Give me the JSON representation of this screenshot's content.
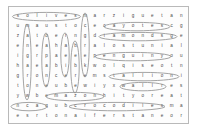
{
  "document": {
    "type": "word-search-puzzle",
    "title": "Word Search Puzzle",
    "grid_rows": 11,
    "grid_cols": 18,
    "ink_color": "#4a4a4a",
    "circle_color": "#8d8d8d",
    "border_color": "#b9b9b9",
    "paper_color": "#fdfdfd"
  },
  "grid": {
    "rows": [
      [
        "s",
        "o",
        "l",
        "i",
        "v",
        "e",
        "s",
        "m",
        "a",
        "r",
        "z",
        "i",
        "g",
        "u",
        "e",
        "t",
        "a",
        "n"
      ],
      [
        "u",
        "m",
        "a",
        "u",
        "s",
        "t",
        "o",
        "c",
        "e",
        "c",
        "a",
        "y",
        "o",
        "t",
        "e",
        "s",
        "c",
        "g"
      ],
      [
        "z",
        "a",
        "t",
        "o",
        "e",
        "r",
        "n",
        "g",
        "d",
        "i",
        "a",
        "m",
        "o",
        "n",
        "d",
        "s",
        "g",
        "e"
      ],
      [
        "e",
        "n",
        "e",
        "a",
        "h",
        "a",
        "b",
        "r",
        "a",
        "l",
        "o",
        "s",
        "t",
        "u",
        "n",
        "i",
        "a",
        "l"
      ],
      [
        "i",
        "g",
        "r",
        "p",
        "a",
        "e",
        "e",
        "e",
        "p",
        "e",
        "n",
        "g",
        "u",
        "i",
        "n",
        "y",
        "o",
        "u"
      ],
      [
        "h",
        "a",
        "e",
        "a",
        "b",
        "i",
        "b",
        "k",
        "w",
        "o",
        "l",
        "q",
        "i",
        "s",
        "e",
        "o",
        "t",
        "n"
      ],
      [
        "g",
        "r",
        "o",
        "n",
        "c",
        "e",
        "r",
        "e",
        "m",
        "s",
        "t",
        "a",
        "l",
        "l",
        "i",
        "o",
        "n",
        "i"
      ],
      [
        "t",
        "o",
        "n",
        "e",
        "u",
        "b",
        "e",
        "w",
        "i",
        "y",
        "x",
        "w",
        "a",
        "l",
        "l",
        "r",
        "e",
        "s"
      ],
      [
        "y",
        "w",
        "b",
        "e",
        "m",
        "a",
        "z",
        "o",
        "n",
        "h",
        "i",
        "t",
        "y",
        "o",
        "r",
        "e",
        "a",
        "t"
      ],
      [
        "n",
        "c",
        "a",
        "q",
        "u",
        "b",
        "c",
        "r",
        "o",
        "c",
        "o",
        "d",
        "i",
        "l",
        "e",
        "s",
        "m",
        "a"
      ],
      [
        "e",
        "s",
        "r",
        "t",
        "o",
        "n",
        "a",
        "i",
        "f",
        "e",
        "r",
        "s",
        "t",
        "a",
        "n",
        "e",
        "o",
        "r"
      ]
    ]
  },
  "found_words": [
    {
      "label": "solives",
      "orientation": "horizontal",
      "row": 0,
      "col_start": 0,
      "col_end": 6
    },
    {
      "label": "cayote",
      "orientation": "horizontal",
      "row": 1,
      "col_start": 9,
      "col_end": 16
    },
    {
      "label": "diamonds",
      "orientation": "horizontal",
      "row": 2,
      "col_start": 8,
      "col_end": 17
    },
    {
      "label": "penguin",
      "orientation": "horizontal",
      "row": 4,
      "col_start": 8,
      "col_end": 16
    },
    {
      "label": "stallion",
      "orientation": "horizontal",
      "row": 6,
      "col_start": 9,
      "col_end": 17
    },
    {
      "label": "wall",
      "orientation": "horizontal",
      "row": 7,
      "col_start": 11,
      "col_end": 15
    },
    {
      "label": "mazon",
      "orientation": "horizontal",
      "row": 8,
      "col_start": 3,
      "col_end": 9
    },
    {
      "label": "cub",
      "orientation": "horizontal",
      "row": 9,
      "col_start": 0,
      "col_end": 3
    },
    {
      "label": "crocodiles",
      "orientation": "horizontal",
      "row": 9,
      "col_start": 6,
      "col_end": 15
    },
    {
      "label": "manger",
      "orientation": "vertical",
      "col": 1,
      "row_start": 1,
      "row_end": 8
    },
    {
      "label": "lateron",
      "orientation": "vertical",
      "col": 3,
      "row_start": 2,
      "row_end": 7
    },
    {
      "label": "aebe",
      "orientation": "vertical",
      "col": 5,
      "row_start": 2,
      "row_end": 6
    },
    {
      "label": "ebzeb",
      "orientation": "vertical",
      "col": 6,
      "row_start": 3,
      "row_end": 8
    },
    {
      "label": "monkey",
      "orientation": "vertical",
      "col": 7,
      "row_start": 0,
      "row_end": 5
    }
  ]
}
